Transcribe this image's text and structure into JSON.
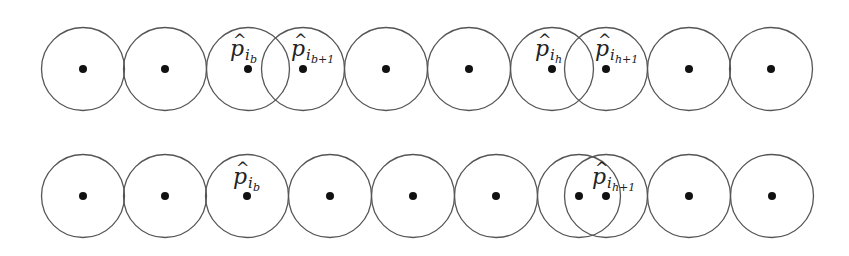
{
  "diagram": {
    "radius": 41.5,
    "colors": {
      "stroke": "#555555",
      "dot": "#111111",
      "text": "#222222",
      "background": "#ffffff"
    },
    "rows": [
      {
        "name": "top-row",
        "cy": 69,
        "circles": [
          {
            "cx": 83
          },
          {
            "cx": 165
          },
          {
            "cx": 248
          },
          {
            "cx": 303
          },
          {
            "cx": 386
          },
          {
            "cx": 469
          },
          {
            "cx": 552
          },
          {
            "cx": 606
          },
          {
            "cx": 689
          },
          {
            "cx": 771
          }
        ],
        "labels": [
          {
            "base": "p",
            "hat": "^",
            "sub": "i",
            "subsub": "b",
            "x": 230,
            "y": 56
          },
          {
            "base": "p",
            "hat": "^",
            "sub": "i",
            "subsub": "b+1",
            "x": 291,
            "y": 56
          },
          {
            "base": "p",
            "hat": "^",
            "sub": "i",
            "subsub": "h",
            "x": 535,
            "y": 56
          },
          {
            "base": "p",
            "hat": "^",
            "sub": "i",
            "subsub": "h+1",
            "x": 595,
            "y": 56
          }
        ]
      },
      {
        "name": "bottom-row",
        "cy": 196,
        "circles": [
          {
            "cx": 83
          },
          {
            "cx": 165
          },
          {
            "cx": 247
          },
          {
            "cx": 330
          },
          {
            "cx": 413
          },
          {
            "cx": 496
          },
          {
            "cx": 579
          },
          {
            "cx": 606
          },
          {
            "cx": 689
          },
          {
            "cx": 772
          }
        ],
        "labels": [
          {
            "base": "p",
            "hat": "^",
            "sub": "i",
            "subsub": "b",
            "x": 233,
            "y": 184
          },
          {
            "base": "p",
            "hat": "^",
            "sub": "i",
            "subsub": "h+1",
            "x": 592,
            "y": 184
          }
        ]
      }
    ]
  }
}
